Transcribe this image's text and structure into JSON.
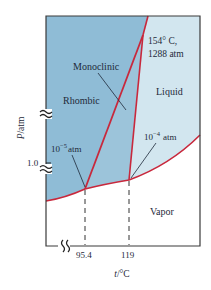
{
  "diagram": {
    "axes": {
      "y_label_italic": "P",
      "y_label_unit": "/atm",
      "x_label_italic": "t",
      "x_label_unit": "/°C",
      "y_tick_label": "1.0",
      "x_tick_labels": [
        "95.4",
        "119"
      ]
    },
    "regions": {
      "rhombic": "Rhombic",
      "monoclinic": "Monoclinic",
      "liquid": "Liquid",
      "vapor": "Vapor"
    },
    "annotations": {
      "triple_point_high_temp": "154° C,",
      "triple_point_high_pressure": "1288 atm",
      "triple_point_low_base": "10",
      "triple_point_low_exp": "−5",
      "triple_point_low_unit": "atm",
      "triple_point_mid_base": "10",
      "triple_point_mid_exp": "−4",
      "triple_point_mid_unit": "atm"
    },
    "colors": {
      "rhombic_fill": "#8fbcd6",
      "monoclinic_fill": "#9cc4da",
      "liquid_fill": "#d2e6ef",
      "vapor_fill": "#ffffff",
      "boundary_line": "#c8283c",
      "frame": "#3a3a3a",
      "text": "#1e2a3a"
    }
  }
}
